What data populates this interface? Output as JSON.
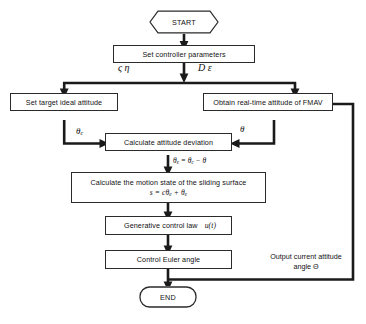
{
  "diagram": {
    "type": "flowchart",
    "background_color": "#ffffff",
    "line_color": "#1a1a1a"
  },
  "nodes": {
    "start": {
      "label": "START",
      "shape": "hexagon"
    },
    "set_params": {
      "label": "Set controller parameters",
      "shape": "rectangle"
    },
    "set_target": {
      "label": "Set target ideal attitude",
      "shape": "rectangle"
    },
    "obtain_attitude": {
      "label": "Obtain real-time attitude of FMAV",
      "shape": "rectangle"
    },
    "calc_deviation": {
      "label": "Calculate attitude deviation",
      "shape": "rectangle"
    },
    "sliding_surface": {
      "label": "Calculate the motion state of the sliding surface",
      "equation_prefix": "s = c",
      "equation_theta1": "θ",
      "equation_sub1": "e",
      "equation_mid": " + ",
      "equation_theta2": "θ",
      "equation_sub2": "e",
      "shape": "rectangle"
    },
    "control_law": {
      "label": "Generative control law",
      "symbol": "u(t)",
      "shape": "rectangle"
    },
    "euler": {
      "label": "Control Euler angle",
      "shape": "rectangle"
    },
    "end": {
      "label": "END",
      "shape": "stadium"
    }
  },
  "edge_labels": {
    "params_left": "ς η",
    "params_right": "D ε",
    "theta_c": "θ",
    "theta_c_sub": "c",
    "theta_plain": "θ",
    "deviation_eq_lhs": "θ",
    "deviation_eq_lhs_sub": "e",
    "deviation_eq_rhs1": "θ",
    "deviation_eq_rhs1_sub": "c",
    "deviation_eq_op": " − ",
    "deviation_eq_rhs2": "θ",
    "feedback_line1": "Output current attitude",
    "feedback_line2": "angle Θ"
  }
}
